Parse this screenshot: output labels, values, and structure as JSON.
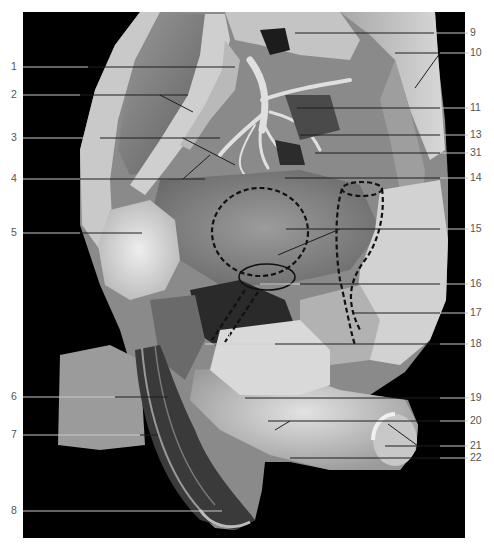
{
  "figure": {
    "type": "anatomical-dissection-photograph",
    "tone": "grayscale",
    "frame": {
      "x": 23,
      "y": 12,
      "width": 442,
      "height": 526,
      "background": "#000000"
    },
    "colors": {
      "background": "#ffffff",
      "photo_background": "#000000",
      "label_text": "#555555",
      "leader_line_light": "#c8c8c8",
      "leader_line_dark": "#1e1e1e",
      "dashed_outline": "#111111"
    }
  },
  "labels_left": [
    {
      "id": "1",
      "text": "1",
      "y": 67
    },
    {
      "id": "2",
      "text": "2",
      "y": 95
    },
    {
      "id": "3",
      "text": "3",
      "y": 138
    },
    {
      "id": "4",
      "text": "4",
      "y": 179
    },
    {
      "id": "5",
      "text": "5",
      "y": 233
    },
    {
      "id": "6",
      "text": "6",
      "y": 397
    },
    {
      "id": "7",
      "text": "7",
      "y": 435
    },
    {
      "id": "8",
      "text": "8",
      "y": 511
    }
  ],
  "labels_right": [
    {
      "id": "9",
      "text": "9",
      "y": 33
    },
    {
      "id": "10",
      "text": "10",
      "y": 53
    },
    {
      "id": "11",
      "text": "11",
      "y": 108
    },
    {
      "id": "13",
      "text": "13",
      "y": 135
    },
    {
      "id": "31",
      "text": "31",
      "y": 153
    },
    {
      "id": "14",
      "text": "14",
      "y": 178
    },
    {
      "id": "15",
      "text": "15",
      "y": 229
    },
    {
      "id": "16",
      "text": "16",
      "y": 284
    },
    {
      "id": "17",
      "text": "17",
      "y": 313
    },
    {
      "id": "18",
      "text": "18",
      "y": 344
    },
    {
      "id": "19",
      "text": "19",
      "y": 398
    },
    {
      "id": "20",
      "text": "20",
      "y": 421
    },
    {
      "id": "21",
      "text": "21",
      "y": 446
    },
    {
      "id": "22",
      "text": "22",
      "y": 458
    }
  ]
}
